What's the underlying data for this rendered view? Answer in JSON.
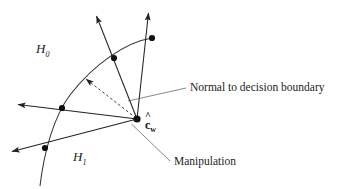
{
  "figure": {
    "background_color": "#ffffff",
    "stroke_color": "#222222",
    "labels": {
      "region_h0": "H",
      "region_h0_sub": "0",
      "region_h1": "H",
      "region_h1_sub": "1",
      "normal_callout": "Normal to decision boundary",
      "manipulation_callout": "Manipulation",
      "center_point_hat": "^",
      "center_point_base": "c",
      "center_point_sub": "w"
    },
    "geometry": {
      "center_point": [
        137,
        119
      ],
      "decision_boundary": "curve from (152,38) arcing left-down through (114,58), (62,108), (45,148) to (40,186)",
      "vectors": [
        {
          "name": "vector-up-left",
          "from": [
            137,
            119
          ],
          "to": [
            95,
            13
          ],
          "crosses_at": [
            114,
            58
          ],
          "style": "solid"
        },
        {
          "name": "vector-up-right",
          "from": [
            137,
            119
          ],
          "to": [
            149,
            10
          ],
          "crosses_at": [
            152,
            38
          ],
          "style": "solid"
        },
        {
          "name": "vector-left-upper",
          "from": [
            137,
            119
          ],
          "to": [
            14,
            104
          ],
          "crosses_at": [
            62,
            108
          ],
          "style": "solid"
        },
        {
          "name": "vector-left-lower",
          "from": [
            137,
            119
          ],
          "to": [
            8,
            153
          ],
          "crosses_at": [
            45,
            148
          ],
          "style": "solid"
        },
        {
          "name": "vector-normal-dashed",
          "from": [
            137,
            119
          ],
          "to": [
            82,
            76
          ],
          "style": "dashed"
        }
      ],
      "leader_lines": [
        {
          "name": "leader-normal",
          "from": [
            186,
            88
          ],
          "to": [
            128,
            101
          ]
        },
        {
          "name": "leader-manipulation",
          "from": [
            170,
            161
          ],
          "to": [
            131,
            124
          ]
        }
      ]
    }
  }
}
